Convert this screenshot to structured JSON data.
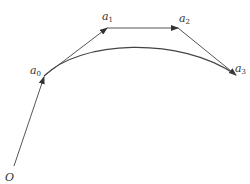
{
  "diagram": {
    "type": "bezier-control-polygon",
    "colors": {
      "line": "#555555",
      "curve": "#444444",
      "text": "#333333",
      "background": "#ffffff"
    },
    "points": {
      "O": {
        "label": "O",
        "sub": "",
        "x": 14,
        "y": 166
      },
      "a0": {
        "label": "a",
        "sub": "0",
        "x": 44,
        "y": 76
      },
      "a1": {
        "label": "a",
        "sub": "1",
        "x": 107,
        "y": 28
      },
      "a2": {
        "label": "a",
        "sub": "2",
        "x": 178,
        "y": 28
      },
      "a3": {
        "label": "a",
        "sub": "3",
        "x": 236,
        "y": 75
      }
    },
    "vectors": [
      {
        "from": "O",
        "to": "a0"
      },
      {
        "from": "a0",
        "to": "a1"
      },
      {
        "from": "a1",
        "to": "a2"
      },
      {
        "from": "a2",
        "to": "a3"
      }
    ],
    "curve": {
      "from": "a0",
      "to": "a3",
      "description": "Bezier curve through a0 and a3"
    }
  }
}
